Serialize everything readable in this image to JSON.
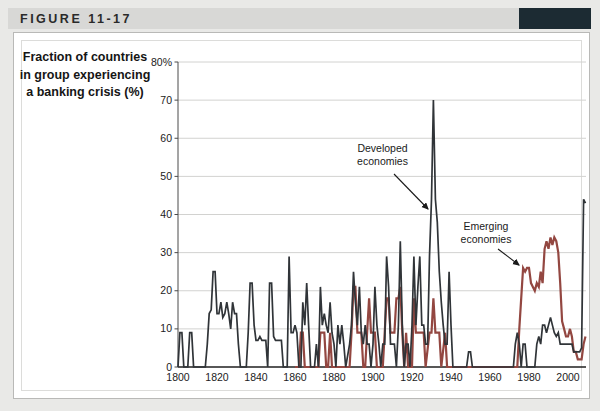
{
  "figure": {
    "label": "FIGURE 11-17"
  },
  "colors": {
    "header_accent": "#1c2b33",
    "page_background": "#e9e9e7",
    "header_bar": "#d8d8d6",
    "gridline": "#d2d2d0",
    "axis": "#1f1f1f"
  },
  "chart_data": {
    "type": "line",
    "title": "Fraction of countries\nin group experiencing\na banking crisis (%)",
    "xlabel": "",
    "ylabel": "Fraction of countries in group experiencing a banking crisis (%)",
    "grid": "horizontal",
    "legend_position": "none",
    "x_range": [
      1800,
      2010
    ],
    "ylim": [
      0,
      80
    ],
    "x_ticks": [
      1800,
      1820,
      1840,
      1860,
      1880,
      1900,
      1920,
      1940,
      1960,
      1980,
      2000
    ],
    "y_tick_values": [
      0,
      10,
      20,
      30,
      40,
      50,
      60,
      70,
      80
    ],
    "y_tick_labels": [
      "0",
      "10",
      "20",
      "30",
      "40",
      "50",
      "60",
      "70",
      "80%"
    ],
    "annotations": [
      {
        "text": "Developed\neconomies",
        "points_to": "developed series spike of 70% circa 1931"
      },
      {
        "text": "Emerging\neconomies",
        "points_to": "emerging series value of 26% circa 1977-1980"
      }
    ],
    "series": [
      {
        "name": "Emerging economies",
        "color": "#934741",
        "points": [
          [
            1860,
            0
          ],
          [
            1862,
            0
          ],
          [
            1863,
            9
          ],
          [
            1864,
            9
          ],
          [
            1865,
            0
          ],
          [
            1872,
            0
          ],
          [
            1873,
            9
          ],
          [
            1874,
            9
          ],
          [
            1875,
            9
          ],
          [
            1876,
            0
          ],
          [
            1877,
            0
          ],
          [
            1878,
            9
          ],
          [
            1879,
            0
          ],
          [
            1888,
            0
          ],
          [
            1889,
            9
          ],
          [
            1890,
            21
          ],
          [
            1891,
            21
          ],
          [
            1892,
            9
          ],
          [
            1893,
            9
          ],
          [
            1894,
            9
          ],
          [
            1895,
            0
          ],
          [
            1896,
            0
          ],
          [
            1897,
            9
          ],
          [
            1898,
            18
          ],
          [
            1899,
            9
          ],
          [
            1900,
            9
          ],
          [
            1901,
            9
          ],
          [
            1902,
            0
          ],
          [
            1905,
            0
          ],
          [
            1906,
            9
          ],
          [
            1907,
            18
          ],
          [
            1908,
            18
          ],
          [
            1909,
            9
          ],
          [
            1910,
            9
          ],
          [
            1911,
            9
          ],
          [
            1912,
            18
          ],
          [
            1913,
            18
          ],
          [
            1914,
            21
          ],
          [
            1915,
            9
          ],
          [
            1916,
            0
          ],
          [
            1917,
            9
          ],
          [
            1918,
            0
          ],
          [
            1920,
            0
          ],
          [
            1921,
            18
          ],
          [
            1922,
            9
          ],
          [
            1923,
            9
          ],
          [
            1925,
            9
          ],
          [
            1926,
            9
          ],
          [
            1927,
            0
          ],
          [
            1929,
            9
          ],
          [
            1930,
            9
          ],
          [
            1931,
            18
          ],
          [
            1932,
            9
          ],
          [
            1933,
            9
          ],
          [
            1934,
            9
          ],
          [
            1935,
            0
          ],
          [
            1937,
            9
          ],
          [
            1938,
            0
          ],
          [
            1948,
            0
          ],
          [
            1960,
            0
          ],
          [
            1974,
            0
          ],
          [
            1975,
            10
          ],
          [
            1976,
            18
          ],
          [
            1977,
            26
          ],
          [
            1978,
            25
          ],
          [
            1979,
            26
          ],
          [
            1980,
            26
          ],
          [
            1981,
            22
          ],
          [
            1982,
            21
          ],
          [
            1983,
            20
          ],
          [
            1984,
            22
          ],
          [
            1985,
            21
          ],
          [
            1986,
            25
          ],
          [
            1987,
            22
          ],
          [
            1988,
            31
          ],
          [
            1989,
            33
          ],
          [
            1990,
            31
          ],
          [
            1991,
            34
          ],
          [
            1992,
            32
          ],
          [
            1993,
            34
          ],
          [
            1994,
            33
          ],
          [
            1995,
            30
          ],
          [
            1996,
            22
          ],
          [
            1997,
            12
          ],
          [
            1998,
            10
          ],
          [
            1999,
            8
          ],
          [
            2000,
            8
          ],
          [
            2001,
            10
          ],
          [
            2002,
            8
          ],
          [
            2003,
            4
          ],
          [
            2004,
            4
          ],
          [
            2005,
            2
          ],
          [
            2006,
            2
          ],
          [
            2007,
            2
          ],
          [
            2008,
            6
          ],
          [
            2009,
            8
          ]
        ]
      },
      {
        "name": "Developed economies",
        "color": "#303438",
        "points": [
          [
            1800,
            0
          ],
          [
            1801,
            9
          ],
          [
            1802,
            9
          ],
          [
            1803,
            0
          ],
          [
            1805,
            0
          ],
          [
            1806,
            9
          ],
          [
            1807,
            9
          ],
          [
            1808,
            0
          ],
          [
            1814,
            0
          ],
          [
            1815,
            6
          ],
          [
            1816,
            14
          ],
          [
            1817,
            15
          ],
          [
            1818,
            25
          ],
          [
            1819,
            25
          ],
          [
            1820,
            14
          ],
          [
            1821,
            14
          ],
          [
            1822,
            17
          ],
          [
            1823,
            13
          ],
          [
            1824,
            14
          ],
          [
            1825,
            17
          ],
          [
            1826,
            14
          ],
          [
            1827,
            10
          ],
          [
            1828,
            17
          ],
          [
            1829,
            14
          ],
          [
            1830,
            14
          ],
          [
            1831,
            6
          ],
          [
            1832,
            0
          ],
          [
            1835,
            0
          ],
          [
            1836,
            9
          ],
          [
            1837,
            22
          ],
          [
            1838,
            22
          ],
          [
            1839,
            11
          ],
          [
            1840,
            7
          ],
          [
            1841,
            7
          ],
          [
            1842,
            8
          ],
          [
            1843,
            7
          ],
          [
            1845,
            7
          ],
          [
            1846,
            0
          ],
          [
            1847,
            22
          ],
          [
            1848,
            22
          ],
          [
            1849,
            8
          ],
          [
            1850,
            7
          ],
          [
            1852,
            7
          ],
          [
            1853,
            7
          ],
          [
            1854,
            0
          ],
          [
            1856,
            0
          ],
          [
            1857,
            29
          ],
          [
            1858,
            9
          ],
          [
            1859,
            9
          ],
          [
            1860,
            11
          ],
          [
            1861,
            9
          ],
          [
            1862,
            0
          ],
          [
            1863,
            0
          ],
          [
            1864,
            17
          ],
          [
            1865,
            11
          ],
          [
            1866,
            22
          ],
          [
            1867,
            11
          ],
          [
            1868,
            0
          ],
          [
            1870,
            0
          ],
          [
            1871,
            6
          ],
          [
            1872,
            0
          ],
          [
            1873,
            21
          ],
          [
            1874,
            11
          ],
          [
            1875,
            14
          ],
          [
            1876,
            11
          ],
          [
            1877,
            9
          ],
          [
            1878,
            17
          ],
          [
            1879,
            9
          ],
          [
            1880,
            6
          ],
          [
            1881,
            0
          ],
          [
            1882,
            11
          ],
          [
            1883,
            6
          ],
          [
            1884,
            11
          ],
          [
            1885,
            6
          ],
          [
            1886,
            0
          ],
          [
            1888,
            6
          ],
          [
            1889,
            11
          ],
          [
            1890,
            25
          ],
          [
            1891,
            17
          ],
          [
            1892,
            11
          ],
          [
            1893,
            21
          ],
          [
            1894,
            9
          ],
          [
            1895,
            6
          ],
          [
            1896,
            11
          ],
          [
            1897,
            6
          ],
          [
            1898,
            6
          ],
          [
            1899,
            0
          ],
          [
            1900,
            6
          ],
          [
            1901,
            21
          ],
          [
            1902,
            11
          ],
          [
            1903,
            6
          ],
          [
            1904,
            0
          ],
          [
            1905,
            6
          ],
          [
            1906,
            6
          ],
          [
            1907,
            29
          ],
          [
            1908,
            21
          ],
          [
            1909,
            6
          ],
          [
            1910,
            6
          ],
          [
            1911,
            6
          ],
          [
            1912,
            0
          ],
          [
            1913,
            11
          ],
          [
            1914,
            33
          ],
          [
            1915,
            11
          ],
          [
            1916,
            0
          ],
          [
            1917,
            6
          ],
          [
            1918,
            6
          ],
          [
            1919,
            0
          ],
          [
            1920,
            11
          ],
          [
            1921,
            29
          ],
          [
            1922,
            11
          ],
          [
            1923,
            21
          ],
          [
            1924,
            29
          ],
          [
            1925,
            11
          ],
          [
            1926,
            11
          ],
          [
            1927,
            6
          ],
          [
            1928,
            6
          ],
          [
            1929,
            29
          ],
          [
            1930,
            44
          ],
          [
            1931,
            70
          ],
          [
            1932,
            44
          ],
          [
            1933,
            38
          ],
          [
            1934,
            25
          ],
          [
            1935,
            17
          ],
          [
            1936,
            11
          ],
          [
            1937,
            6
          ],
          [
            1938,
            6
          ],
          [
            1939,
            25
          ],
          [
            1940,
            11
          ],
          [
            1941,
            0
          ],
          [
            1948,
            0
          ],
          [
            1949,
            4
          ],
          [
            1950,
            4
          ],
          [
            1951,
            0
          ],
          [
            1960,
            0
          ],
          [
            1972,
            0
          ],
          [
            1973,
            6
          ],
          [
            1974,
            9
          ],
          [
            1975,
            6
          ],
          [
            1976,
            0
          ],
          [
            1977,
            6
          ],
          [
            1978,
            6
          ],
          [
            1979,
            0
          ],
          [
            1983,
            0
          ],
          [
            1984,
            6
          ],
          [
            1985,
            8
          ],
          [
            1986,
            6
          ],
          [
            1987,
            11
          ],
          [
            1988,
            11
          ],
          [
            1989,
            9
          ],
          [
            1990,
            11
          ],
          [
            1991,
            13
          ],
          [
            1992,
            11
          ],
          [
            1993,
            9
          ],
          [
            1994,
            8
          ],
          [
            1995,
            9
          ],
          [
            1996,
            6
          ],
          [
            1997,
            6
          ],
          [
            1998,
            6
          ],
          [
            1999,
            6
          ],
          [
            2000,
            6
          ],
          [
            2001,
            6
          ],
          [
            2002,
            6
          ],
          [
            2003,
            4
          ],
          [
            2004,
            4
          ],
          [
            2005,
            4
          ],
          [
            2006,
            4
          ],
          [
            2007,
            5
          ],
          [
            2008,
            44
          ],
          [
            2009,
            43
          ]
        ]
      }
    ]
  }
}
